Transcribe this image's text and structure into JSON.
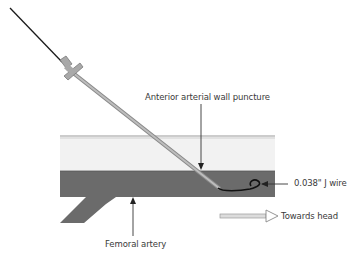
{
  "diagram": {
    "labels": {
      "puncture": "Anterior arterial wall puncture",
      "wire": "0.038\" J wire",
      "direction": "Towards head",
      "artery": "Femoral artery"
    },
    "colors": {
      "artery": "#6b6b6b",
      "tissue": "#f2f2f2",
      "tissue_line": "#9a9a9a",
      "needle": "#a9a9a9",
      "wire": "#1a1a1a",
      "text": "#3a3a3a"
    }
  }
}
